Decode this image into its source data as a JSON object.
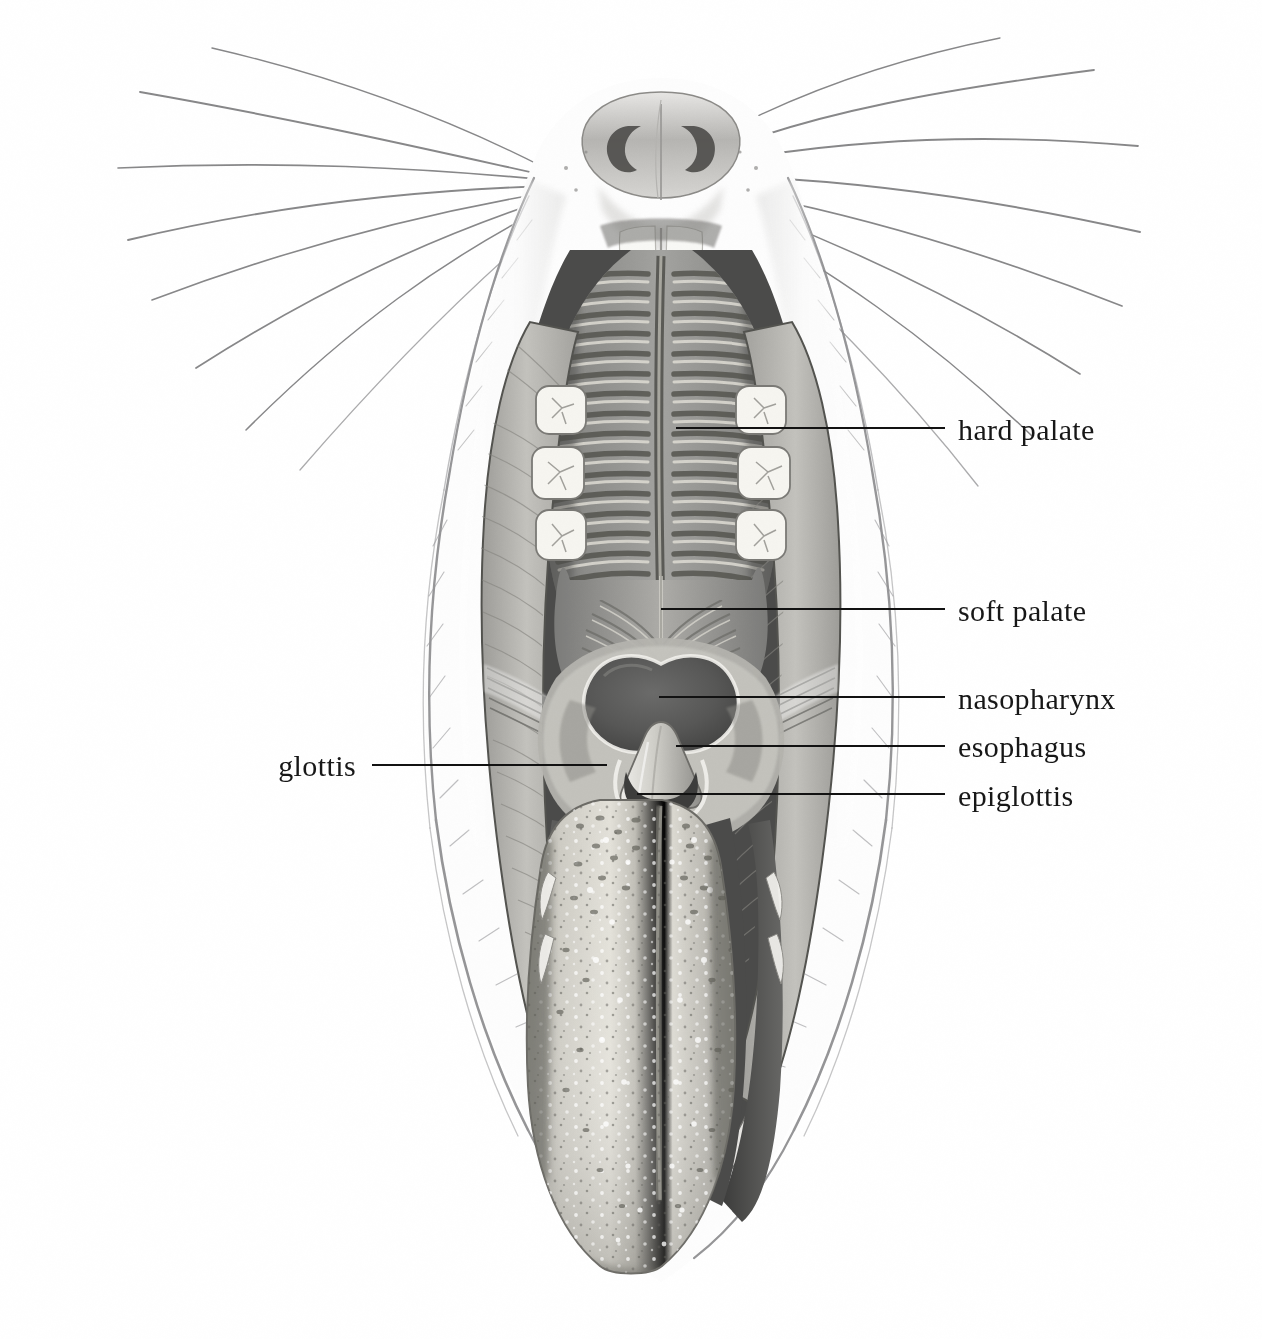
{
  "figure": {
    "kind": "anatomical-illustration",
    "style": "grayscale pencil / stipple rendering",
    "background_color": "#ffffff",
    "ink_color": "#121212",
    "width": 1262,
    "height": 1339
  },
  "labels": [
    {
      "id": "hard-palate",
      "text": "hard palate",
      "side": "right",
      "text_x": 958,
      "text_y": 440,
      "leader": {
        "x1": 676,
        "y1": 428,
        "x2": 945,
        "y2": 428
      }
    },
    {
      "id": "soft-palate",
      "text": "soft palate",
      "side": "right",
      "text_x": 958,
      "text_y": 621,
      "leader": {
        "x1": 661,
        "y1": 609,
        "x2": 945,
        "y2": 609
      }
    },
    {
      "id": "nasopharynx",
      "text": "nasopharynx",
      "side": "right",
      "text_x": 958,
      "text_y": 709,
      "leader": {
        "x1": 659,
        "y1": 697,
        "x2": 945,
        "y2": 697
      }
    },
    {
      "id": "esophagus",
      "text": "esophagus",
      "side": "right",
      "text_x": 958,
      "text_y": 757,
      "leader": {
        "x1": 676,
        "y1": 746,
        "x2": 945,
        "y2": 746
      }
    },
    {
      "id": "epiglottis",
      "text": "epiglottis",
      "side": "right",
      "text_x": 958,
      "text_y": 806,
      "leader": {
        "x1": 637,
        "y1": 794,
        "x2": 945,
        "y2": 794
      }
    },
    {
      "id": "glottis",
      "text": "glottis",
      "side": "left",
      "text_x": 356,
      "text_y": 776,
      "leader": {
        "x1": 372,
        "y1": 765,
        "x2": 607,
        "y2": 765
      }
    }
  ],
  "structures": [
    {
      "name": "rhinarium",
      "note": "nose pad with two comma-shaped nostrils"
    },
    {
      "name": "incisors",
      "note": "pair of white upper incisors at midline"
    },
    {
      "name": "palatal-rugae",
      "note": "about 18 transverse ridges either side of the midline raphe"
    },
    {
      "name": "molars",
      "note": "three cheek teeth on each side"
    },
    {
      "name": "cheek-flap",
      "note": "pale muscular cheek wall on each side"
    },
    {
      "name": "nasopharynx-opening",
      "note": "dark heart-shaped aperture"
    },
    {
      "name": "epiglottis",
      "note": "pale triangular cartilage"
    },
    {
      "name": "glottis",
      "note": "dark slit beneath the epiglottis"
    },
    {
      "name": "tongue",
      "note": "long pale tongue with papillae speckles"
    },
    {
      "name": "whiskers",
      "note": "long vibrissae radiating from each side of the snout"
    }
  ],
  "palette": {
    "paper": "#ffffff",
    "fur_light": "#f7f7f6",
    "fur_shadow": "#d3d3d2",
    "mucosa_mid": "#8e8e8c",
    "mucosa_dark": "#5b5b5a",
    "cavity_dark": "#4a4a49",
    "tongue_light": "#d6d5ce",
    "tooth_white": "#fbfbf8",
    "outline": "#3a3a39"
  }
}
